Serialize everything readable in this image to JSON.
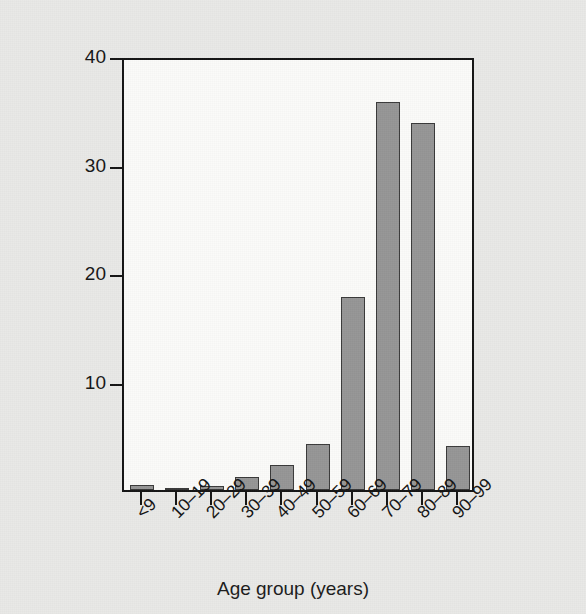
{
  "chart_data": {
    "type": "bar",
    "title": "",
    "subtitle": "",
    "xlabel": "Age group (years)",
    "ylabel": "Fatalities (percent)",
    "categories": [
      "<9",
      "10–19",
      "20–29",
      "30–39",
      "40–49",
      "50–59",
      "60–69",
      "70–79",
      "80–89",
      "90–99"
    ],
    "values": [
      0.5,
      0.1,
      0.4,
      1.2,
      2.3,
      4.2,
      17.8,
      35.8,
      33.8,
      4.1
    ],
    "ylim": [
      0,
      40
    ],
    "yticks": [
      10,
      20,
      30,
      40
    ],
    "ytick_labels": [
      "10",
      "20",
      "30",
      "40"
    ],
    "grid": false,
    "legend": false,
    "legend_position": "none",
    "bar_fill_color": "#969696",
    "bar_edge_color": "#3a3a3a",
    "plot_background_color": "#fbfbf9",
    "figure_background_color": "#e9e9e7",
    "axis_color": "#141414",
    "text_color": "#161616",
    "xtick_label_rotation": -45
  }
}
